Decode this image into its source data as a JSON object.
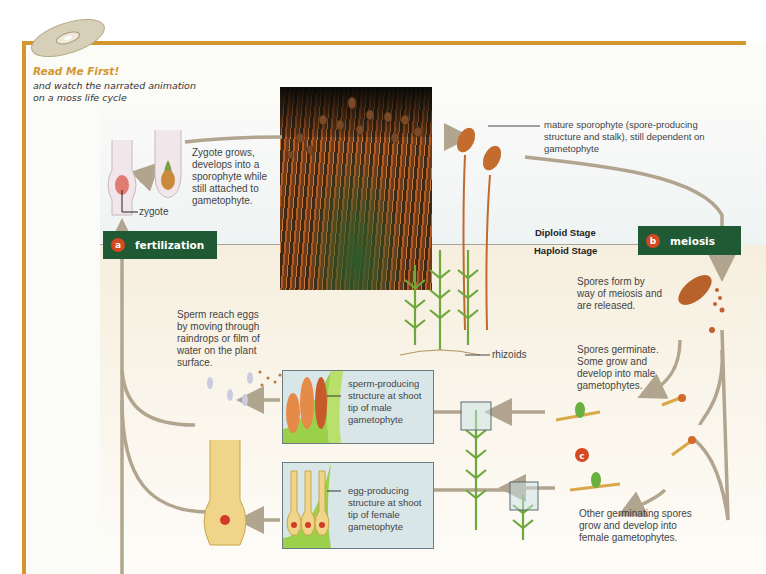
{
  "header": {
    "title": "Read Me First!",
    "subtitle": "and watch the narrated animation on a moss life cycle",
    "cd_icon": "cd-disc-icon"
  },
  "colors": {
    "frame": "#d4962f",
    "step_box": "#1f5a34",
    "badge": "#d4491f",
    "arrow": "#b2a58f"
  },
  "stages": {
    "diploid": "Diploid Stage",
    "haploid": "Haploid Stage"
  },
  "steps": [
    {
      "letter": "a",
      "label": "fertilization"
    },
    {
      "letter": "b",
      "label": "meiosis"
    },
    {
      "letter": "c",
      "label": ""
    }
  ],
  "labels": {
    "zygote": "zygote",
    "zygote_grows": "Zygote grows, develops into a sporophyte while still attached to gametophyte.",
    "mature_sporophyte": "mature sporophyte (spore-producing structure and stalk), still dependent on gametophyte",
    "rhizoids": "rhizoids",
    "spores_form": "Spores form by way of meiosis and are released.",
    "spores_germinate": "Spores germinate. Some grow and develop into male gametophytes.",
    "other_spores": "Other germinating spores grow and develop into female gametophytes.",
    "sperm_reach": "Sperm reach eggs by moving through raindrops or film of water on the plant surface.",
    "sperm_structure": "sperm-producing structure at shoot tip of male gametophyte",
    "egg_structure": "egg-producing structure at shoot tip of female gametophyte"
  }
}
